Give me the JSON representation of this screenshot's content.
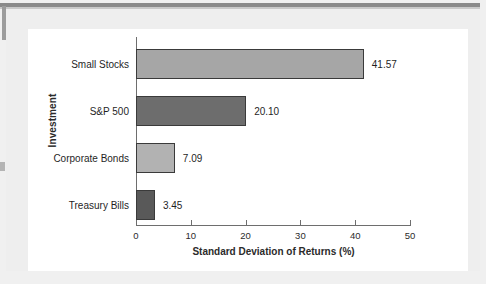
{
  "chart_data": {
    "type": "bar",
    "orientation": "horizontal",
    "title": "",
    "xlabel": "Standard Deviation of Returns (%)",
    "ylabel": "Investment",
    "categories": [
      "Small Stocks",
      "S&P 500",
      "Corporate Bonds",
      "Treasury Bills"
    ],
    "values": [
      41.57,
      20.1,
      7.09,
      3.45
    ],
    "value_labels": [
      "41.57",
      "20.10",
      "7.09",
      "3.45"
    ],
    "bar_colors": [
      "#a6a6a6",
      "#6d6d6d",
      "#b2b2b2",
      "#595959"
    ],
    "bar_border_color": "#3a3a3a",
    "xlim": [
      0,
      50
    ],
    "xticks": [
      0,
      10,
      20,
      30,
      40,
      50
    ],
    "xtick_labels": [
      "0",
      "10",
      "20",
      "30",
      "40",
      "50"
    ],
    "grid": false,
    "legend": false,
    "axis_color": "#6e6e6e",
    "panel_color": "#ffffff",
    "page_color": "#eeeeee"
  },
  "figure": {
    "y_axis_title": "Investment",
    "x_axis_title": "Standard Deviation of Returns (%)"
  }
}
